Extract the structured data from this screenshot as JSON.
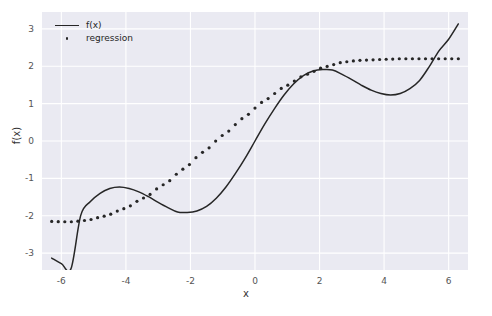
{
  "chart_data": {
    "type": "line",
    "title": "",
    "xlabel": "x",
    "ylabel": "f(x)",
    "xlim": [
      -6.6,
      6.6
    ],
    "ylim": [
      -3.45,
      3.45
    ],
    "grid": true,
    "legend_position": "upper left",
    "xticks": [
      "-6",
      "-4",
      "-2",
      "0",
      "2",
      "4",
      "6"
    ],
    "xtick_values": [
      -6,
      -4,
      -2,
      0,
      2,
      4,
      6
    ],
    "yticks": [
      "3",
      "2",
      "1",
      "0",
      "-1",
      "-2",
      "-3"
    ],
    "ytick_values": [
      3,
      2,
      1,
      0,
      -1,
      -2,
      -3
    ],
    "series": [
      {
        "name": "f(x)",
        "style": "solid-line",
        "color": "#262626",
        "x": [
          -6.3,
          -6.0,
          -5.7,
          -5.4,
          -5.1,
          -4.8,
          -4.5,
          -4.2,
          -3.9,
          -3.6,
          -3.3,
          -3.0,
          -2.7,
          -2.4,
          -2.1,
          -1.8,
          -1.5,
          -1.2,
          -0.9,
          -0.6,
          -0.3,
          0.0,
          0.3,
          0.6,
          0.9,
          1.2,
          1.5,
          1.8,
          2.1,
          2.4,
          2.7,
          3.0,
          3.3,
          3.6,
          3.9,
          4.2,
          4.5,
          4.8,
          5.1,
          5.4,
          5.7,
          6.0,
          6.3
        ],
        "y": [
          -3.13,
          -3.28,
          -3.41,
          -1.99,
          -1.62,
          -1.4,
          -1.27,
          -1.23,
          -1.27,
          -1.36,
          -1.49,
          -1.64,
          -1.78,
          -1.9,
          -1.91,
          -1.87,
          -1.75,
          -1.53,
          -1.23,
          -0.86,
          -0.45,
          0.0,
          0.45,
          0.86,
          1.23,
          1.53,
          1.75,
          1.87,
          1.91,
          1.9,
          1.78,
          1.64,
          1.49,
          1.36,
          1.27,
          1.23,
          1.27,
          1.4,
          1.62,
          1.99,
          2.41,
          2.72,
          3.13
        ],
        "note": "approximately f(x) = x/2 + sin(x)"
      },
      {
        "name": "regression",
        "style": "dotted",
        "color": "#262626",
        "x": [
          -6.3,
          -6.0,
          -5.7,
          -5.4,
          -5.1,
          -4.8,
          -4.5,
          -4.2,
          -3.9,
          -3.6,
          -3.3,
          -3.0,
          -2.7,
          -2.4,
          -2.1,
          -1.8,
          -1.5,
          -1.2,
          -0.9,
          -0.6,
          -0.3,
          0.0,
          0.3,
          0.6,
          0.9,
          1.2,
          1.5,
          1.8,
          2.1,
          2.4,
          2.7,
          3.0,
          3.3,
          3.6,
          3.9,
          4.2,
          4.5,
          4.8,
          5.1,
          5.4,
          5.7,
          6.0,
          6.3
        ],
        "y": [
          -2.15,
          -2.16,
          -2.16,
          -2.14,
          -2.1,
          -2.04,
          -1.96,
          -1.86,
          -1.74,
          -1.6,
          -1.44,
          -1.27,
          -1.08,
          -0.88,
          -0.66,
          -0.44,
          -0.22,
          0.0,
          0.22,
          0.44,
          0.66,
          0.88,
          1.08,
          1.27,
          1.44,
          1.6,
          1.74,
          1.86,
          1.96,
          2.04,
          2.1,
          2.14,
          2.16,
          2.17,
          2.18,
          2.19,
          2.2,
          2.2,
          2.2,
          2.2,
          2.2,
          2.2,
          2.2
        ],
        "note": "smooth monotonic sigmoid-like fit"
      }
    ]
  },
  "legend": {
    "entries": [
      {
        "label": "f(x)",
        "marker": "line"
      },
      {
        "label": "regression",
        "marker": "dot"
      }
    ]
  },
  "colors": {
    "axes_background": "#eaeaf2",
    "figure_background": "#ffffff",
    "grid": "#ffffff",
    "line": "#262626",
    "tick_text": "#555555",
    "label_text": "#333333"
  }
}
